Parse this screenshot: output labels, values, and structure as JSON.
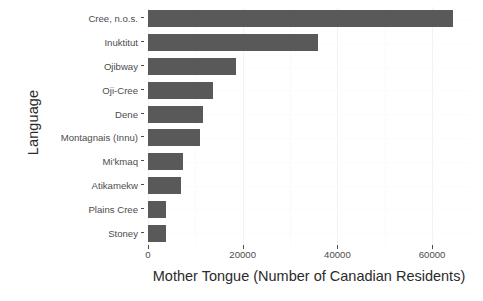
{
  "chart_data": {
    "type": "bar",
    "orientation": "horizontal",
    "title": "",
    "xlabel": "Mother Tongue (Number of Canadian Residents)",
    "ylabel": "Language",
    "categories": [
      "Cree, n.o.s.",
      "Inuktitut",
      "Ojibway",
      "Oji-Cree",
      "Dene",
      "Montagnais (Innu)",
      "Mi'kmaq",
      "Atikamekw",
      "Plains Cree",
      "Stoney"
    ],
    "values": [
      64500,
      35800,
      18500,
      13800,
      11700,
      11000,
      7400,
      7000,
      3800,
      3800
    ],
    "xlim": [
      0,
      68000
    ],
    "xticks": [
      0,
      20000,
      40000,
      60000
    ],
    "xtick_labels": [
      "0",
      "20000",
      "40000",
      "60000"
    ],
    "grid": true,
    "legend": "none",
    "bar_color": "#595959",
    "panel_background": "#ffffff",
    "grid_color": "#f2f2f2"
  }
}
